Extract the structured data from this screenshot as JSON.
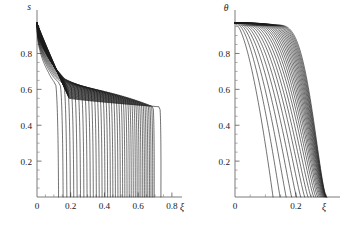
{
  "figure": {
    "title": "",
    "background_color": "#ffffff",
    "curve_color": "#1a1a1a",
    "axis_color": "#6b6b6b"
  },
  "chart_data": [
    {
      "type": "line",
      "panel": "left",
      "title": "",
      "xlabel": "ξ",
      "ylabel": "s",
      "xlim": [
        0,
        0.86
      ],
      "ylim": [
        0,
        1.02
      ],
      "xticks": [
        0,
        0.2,
        0.4,
        0.6,
        0.8
      ],
      "xticklabels": [
        "0",
        "0.2",
        "0.4",
        "0.6",
        "0.8"
      ],
      "yticks": [
        0.2,
        0.4,
        0.6,
        0.8
      ],
      "yticklabels": [
        "0.2",
        "0.4",
        "0.6",
        "0.8"
      ],
      "grid": false,
      "legend": null,
      "n_curves": 40,
      "description": "Family of saturation profiles s(ξ): each curve starts near s=0.97 at ξ=0, decreases through a dense shoulder near s≈0.80, flattens to a slowly decaying plateau around s≈0.52-0.66, then falls almost vertically to s=0 at its own front position.",
      "curve_params": {
        "s_start": 0.97,
        "shoulder_s": 0.8,
        "plateau_s_first": 0.655,
        "plateau_s_last": 0.515,
        "front_positions": [
          0.128,
          0.155,
          0.177,
          0.198,
          0.218,
          0.238,
          0.258,
          0.278,
          0.297,
          0.316,
          0.334,
          0.352,
          0.369,
          0.386,
          0.403,
          0.419,
          0.435,
          0.45,
          0.465,
          0.48,
          0.494,
          0.508,
          0.521,
          0.534,
          0.547,
          0.559,
          0.571,
          0.583,
          0.594,
          0.605,
          0.616,
          0.627,
          0.637,
          0.647,
          0.657,
          0.667,
          0.676,
          0.686,
          0.695,
          0.735
        ]
      }
    },
    {
      "type": "line",
      "panel": "right",
      "title": "",
      "xlabel": "ξ",
      "ylabel": "θ",
      "xlim": [
        0,
        0.345
      ],
      "ylim": [
        0,
        1.02
      ],
      "xticks": [
        0,
        0.2
      ],
      "xticklabels": [
        "0",
        "0.2"
      ],
      "yticks": [
        0.2,
        0.4,
        0.6,
        0.8
      ],
      "yticklabels": [
        "0.2",
        "0.4",
        "0.6",
        "0.8"
      ],
      "grid": false,
      "legend": null,
      "n_curves": 26,
      "description": "Family of temperature profiles θ(ξ): each curve begins near θ=0.97 at ξ=0 with a flat cap that lengthens for later curves, then drops in a smooth sigmoid to θ=0 at its own thermal front; fronts accumulate densely near ξ≈0.27-0.29.",
      "curve_params": {
        "theta_start": 0.97,
        "front_positions": [
          0.125,
          0.148,
          0.168,
          0.186,
          0.202,
          0.216,
          0.229,
          0.24,
          0.25,
          0.259,
          0.266,
          0.272,
          0.277,
          0.281,
          0.2845,
          0.2875,
          0.29,
          0.2922,
          0.294,
          0.2956,
          0.297,
          0.2982,
          0.2992,
          0.3,
          0.3007,
          0.3013
        ],
        "cap_fraction_first": 0.04,
        "cap_fraction_last": 0.46
      }
    }
  ]
}
